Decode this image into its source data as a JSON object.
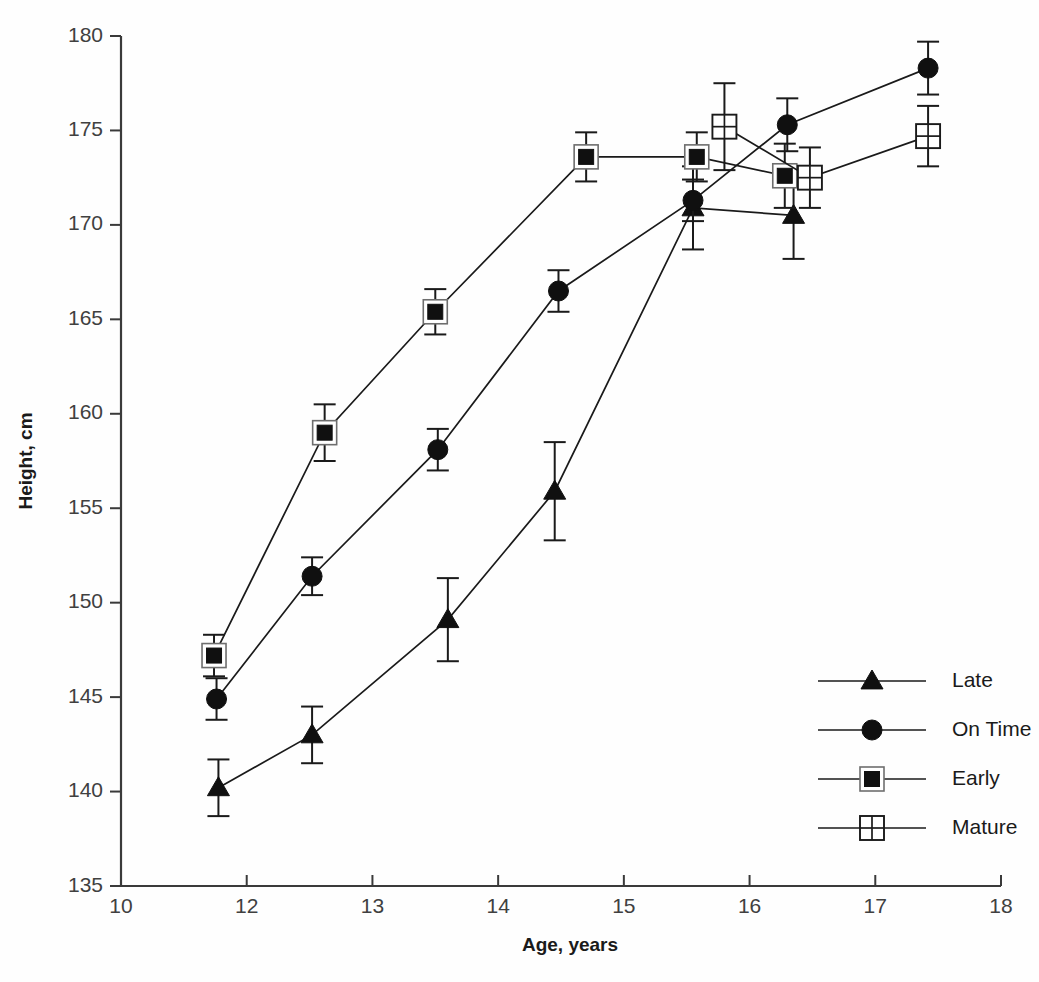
{
  "chart_data": {
    "type": "line",
    "title": "",
    "subtitle": "",
    "xlabel": "Age, years",
    "ylabel": "Height, cm",
    "xlim": [
      10,
      18
    ],
    "ylim": [
      135,
      180
    ],
    "xticks": [
      10,
      12,
      13,
      14,
      15,
      16,
      17,
      18
    ],
    "xtick_labels": [
      "10",
      "12",
      "13",
      "14",
      "15",
      "16",
      "17",
      "18"
    ],
    "yticks": [
      135,
      140,
      145,
      150,
      155,
      160,
      165,
      170,
      175,
      180
    ],
    "ytick_labels": [
      "135",
      "140",
      "145",
      "150",
      "155",
      "160",
      "165",
      "170",
      "175",
      "180"
    ],
    "grid": false,
    "legend_position": "lower-right",
    "error_bars": "vertical, symmetric (standard error)",
    "series": [
      {
        "name": "Late",
        "marker": "filled-triangle",
        "points": [
          {
            "x": 11.55,
            "y": 140.2,
            "err": 1.5
          },
          {
            "x": 12.52,
            "y": 143.0,
            "err": 1.5
          },
          {
            "x": 13.6,
            "y": 149.1,
            "err": 2.2
          },
          {
            "x": 14.45,
            "y": 155.9,
            "err": 2.6
          },
          {
            "x": 15.55,
            "y": 170.9,
            "err": 2.2
          },
          {
            "x": 16.35,
            "y": 170.5,
            "err": 2.3
          }
        ]
      },
      {
        "name": "On Time",
        "marker": "filled-circle",
        "points": [
          {
            "x": 11.52,
            "y": 144.9,
            "err": 1.1
          },
          {
            "x": 12.52,
            "y": 151.4,
            "err": 1.0
          },
          {
            "x": 13.52,
            "y": 158.1,
            "err": 1.1
          },
          {
            "x": 14.48,
            "y": 166.5,
            "err": 1.1
          },
          {
            "x": 15.55,
            "y": 171.3,
            "err": 1.1
          },
          {
            "x": 16.3,
            "y": 175.3,
            "err": 1.4
          },
          {
            "x": 17.42,
            "y": 178.3,
            "err": 1.4
          }
        ]
      },
      {
        "name": "Early",
        "marker": "filled-square-outlined",
        "points": [
          {
            "x": 11.48,
            "y": 147.2,
            "err": 1.1
          },
          {
            "x": 12.62,
            "y": 159.0,
            "err": 1.5
          },
          {
            "x": 13.5,
            "y": 165.4,
            "err": 1.2
          },
          {
            "x": 14.7,
            "y": 173.6,
            "err": 1.3
          },
          {
            "x": 15.58,
            "y": 173.6,
            "err": 1.3
          },
          {
            "x": 16.28,
            "y": 172.6,
            "err": 1.7
          }
        ]
      },
      {
        "name": "Mature",
        "marker": "open-square-cross",
        "points": [
          {
            "x": 15.8,
            "y": 175.2,
            "err": 2.3
          },
          {
            "x": 16.48,
            "y": 172.5,
            "err": 1.6
          },
          {
            "x": 17.42,
            "y": 174.7,
            "err": 1.6
          }
        ]
      }
    ]
  },
  "legend": {
    "items": [
      {
        "label": "Late",
        "marker": "filled-triangle"
      },
      {
        "label": "On Time",
        "marker": "filled-circle"
      },
      {
        "label": "Early",
        "marker": "filled-square-outlined"
      },
      {
        "label": "Mature",
        "marker": "open-square-cross"
      }
    ]
  },
  "colors": {
    "ink": "#1a1a1a",
    "axis": "#3a3a3a",
    "tick_text": "#404040",
    "background": "#fefefe",
    "marker_outline": "#6e6e6e"
  }
}
